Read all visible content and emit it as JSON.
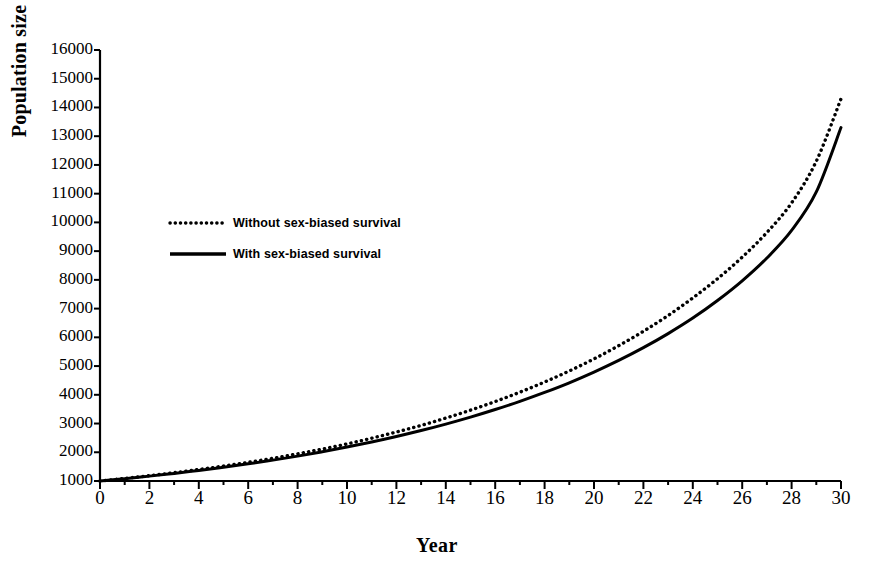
{
  "chart_data": {
    "type": "line",
    "title": "",
    "xlabel": "Year",
    "ylabel": "Population size",
    "xlim": [
      0,
      30
    ],
    "ylim": [
      1000,
      16000
    ],
    "grid": false,
    "legend_position": "upper-left-inside",
    "x": [
      0,
      1,
      2,
      3,
      4,
      5,
      6,
      7,
      8,
      9,
      10,
      11,
      12,
      13,
      14,
      15,
      16,
      17,
      18,
      19,
      20,
      21,
      22,
      23,
      24,
      25,
      26,
      27,
      28,
      29,
      30
    ],
    "xticks": [
      "0",
      "2",
      "4",
      "6",
      "8",
      "10",
      "12",
      "14",
      "16",
      "18",
      "20",
      "22",
      "24",
      "26",
      "28",
      "30"
    ],
    "xtick_values": [
      0,
      2,
      4,
      6,
      8,
      10,
      12,
      14,
      16,
      18,
      20,
      22,
      24,
      26,
      28,
      30
    ],
    "yticks": [
      "1000",
      "2000",
      "3000",
      "4000",
      "5000",
      "6000",
      "7000",
      "8000",
      "9000",
      "10000",
      "11000",
      "12000",
      "13000",
      "14000",
      "15000",
      "16000"
    ],
    "ytick_values": [
      1000,
      2000,
      3000,
      4000,
      5000,
      6000,
      7000,
      8000,
      9000,
      10000,
      11000,
      12000,
      13000,
      14000,
      15000,
      16000
    ],
    "series": [
      {
        "name": "Without sex-biased survival",
        "style": "dotted",
        "color": "#000000",
        "values": [
          1000,
          1090,
          1185,
          1290,
          1400,
          1520,
          1650,
          1790,
          1945,
          2110,
          2290,
          2490,
          2705,
          2935,
          3190,
          3465,
          3765,
          4090,
          4445,
          4830,
          5250,
          5710,
          6210,
          6760,
          7370,
          8040,
          8790,
          9650,
          10680,
          12130,
          14300
        ]
      },
      {
        "name": "With sex-biased survival",
        "style": "solid",
        "color": "#000000",
        "values": [
          1000,
          1082,
          1170,
          1265,
          1368,
          1478,
          1598,
          1727,
          1866,
          2017,
          2180,
          2357,
          2548,
          2755,
          2980,
          3223,
          3487,
          3772,
          4082,
          4418,
          4790,
          5195,
          5640,
          6130,
          6670,
          7280,
          7965,
          8760,
          9720,
          11060,
          13300
        ]
      }
    ],
    "legend": [
      {
        "label": "Without sex-biased survival",
        "style": "dotted"
      },
      {
        "label": "With sex-biased survival",
        "style": "solid"
      }
    ]
  }
}
